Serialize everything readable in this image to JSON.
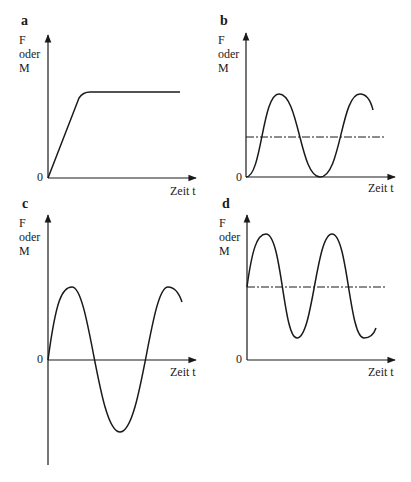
{
  "panels": [
    {
      "id": "a",
      "label": "a",
      "y_label": [
        "F",
        "oder",
        "M"
      ],
      "zero": "0",
      "x_label": "Zeit t",
      "curve": "ramp-then-constant"
    },
    {
      "id": "b",
      "label": "b",
      "y_label": [
        "F",
        "oder",
        "M"
      ],
      "zero": "0",
      "x_label": "Zeit t",
      "curve": "pulsating (sine from 0, mean dash-dot line)"
    },
    {
      "id": "c",
      "label": "c",
      "y_label": [
        "F",
        "oder",
        "M"
      ],
      "zero": "0",
      "x_label": "Zeit t",
      "curve": "alternating (sine about 0)"
    },
    {
      "id": "d",
      "label": "d",
      "y_label": [
        "F",
        "oder",
        "M"
      ],
      "zero": "0",
      "x_label": "Zeit t",
      "curve": "fluctuating (sine about positive mean, dash-dot line)"
    }
  ],
  "colors": {
    "line": "#1a1a1a",
    "background": "#ffffff"
  }
}
